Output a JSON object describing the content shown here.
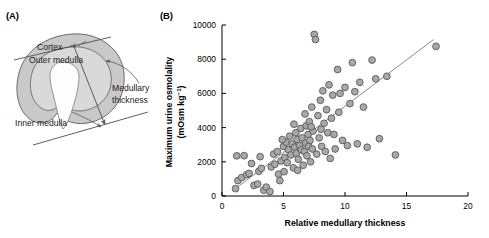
{
  "figure": {
    "panel_a_label": "(A)",
    "panel_b_label": "(B)"
  },
  "diagram": {
    "name": "kidney-medullary-thickness-diagram",
    "labels": {
      "cortex": "Cortex",
      "outer_medulla": "Outer medulla",
      "inner_medulla": "Inner medulla",
      "medullary_thickness_line1": "Medullary",
      "medullary_thickness_line2": "thickness"
    },
    "colors": {
      "cortex_fill": "#c9c9c9",
      "outer_medulla_fill": "#d9d9d9",
      "inner_medulla_fill": "#fdfdfd",
      "outline": "#6b6b6b",
      "arrow": "#5a5a5a"
    }
  },
  "chart_data": {
    "type": "scatter",
    "title": "",
    "xlabel": "Relative medullary thickness",
    "ylabel": "Maximum urine osmolality",
    "ylabel_units": "(mOsm kg",
    "ylabel_exponent": "−1",
    "ylabel_units_close": ")",
    "xlim": [
      0,
      20
    ],
    "ylim": [
      0,
      10000
    ],
    "xticks": [
      0,
      5,
      10,
      15,
      20
    ],
    "xtick_labels": [
      "0",
      "5",
      "10",
      "15",
      "20"
    ],
    "yticks": [
      0,
      2000,
      4000,
      6000,
      8000,
      10000
    ],
    "ytick_labels": [
      "0",
      "2000",
      "4000",
      "6000",
      "8000",
      "10000"
    ],
    "grid": false,
    "legend": false,
    "marker": {
      "shape": "circle",
      "fill": "#a8a8a8",
      "edge": "#4d4d4d",
      "size": 3.4
    },
    "trendline": {
      "visible": true,
      "color": "#8a8a8a",
      "x_start": 1.0,
      "y_start": 380,
      "x_end": 17.2,
      "y_end": 9150
    },
    "points": [
      [
        1.2,
        2350
      ],
      [
        1.8,
        2360
      ],
      [
        1.3,
        900
      ],
      [
        1.6,
        1080
      ],
      [
        2.0,
        1240
      ],
      [
        2.2,
        1320
      ],
      [
        1.1,
        430
      ],
      [
        2.6,
        620
      ],
      [
        2.9,
        700
      ],
      [
        3.0,
        1450
      ],
      [
        3.2,
        1620
      ],
      [
        3.4,
        340
      ],
      [
        3.6,
        520
      ],
      [
        3.9,
        260
      ],
      [
        4.0,
        1700
      ],
      [
        4.2,
        2450
      ],
      [
        4.3,
        1860
      ],
      [
        4.5,
        2600
      ],
      [
        4.6,
        1280
      ],
      [
        4.7,
        900
      ],
      [
        4.8,
        2050
      ],
      [
        5.0,
        2900
      ],
      [
        5.1,
        2250
      ],
      [
        5.2,
        3150
      ],
      [
        5.3,
        1950
      ],
      [
        5.4,
        2700
      ],
      [
        5.5,
        3500
      ],
      [
        5.6,
        2400
      ],
      [
        5.7,
        3050
      ],
      [
        5.8,
        1650
      ],
      [
        5.9,
        2850
      ],
      [
        6.0,
        3700
      ],
      [
        6.05,
        2500
      ],
      [
        6.1,
        3300
      ],
      [
        6.2,
        2150
      ],
      [
        6.3,
        2950
      ],
      [
        6.4,
        3950
      ],
      [
        6.45,
        2700
      ],
      [
        6.5,
        3400
      ],
      [
        6.6,
        1800
      ],
      [
        6.7,
        2600
      ],
      [
        6.8,
        3100
      ],
      [
        6.85,
        4100
      ],
      [
        6.9,
        2350
      ],
      [
        7.0,
        3600
      ],
      [
        7.05,
        2900
      ],
      [
        7.1,
        4350
      ],
      [
        7.15,
        3250
      ],
      [
        7.2,
        2000
      ],
      [
        7.3,
        5200
      ],
      [
        7.35,
        2750
      ],
      [
        7.4,
        3800
      ],
      [
        7.5,
        9450
      ],
      [
        7.6,
        9150
      ],
      [
        7.7,
        2450
      ],
      [
        7.8,
        4700
      ],
      [
        7.9,
        3400
      ],
      [
        8.0,
        5600
      ],
      [
        8.1,
        2900
      ],
      [
        8.2,
        6150
      ],
      [
        8.3,
        4250
      ],
      [
        8.4,
        2600
      ],
      [
        8.5,
        5050
      ],
      [
        8.6,
        3700
      ],
      [
        8.7,
        6500
      ],
      [
        8.8,
        2200
      ],
      [
        8.9,
        4550
      ],
      [
        9.0,
        5900
      ],
      [
        9.2,
        2750
      ],
      [
        9.4,
        7400
      ],
      [
        9.5,
        4900
      ],
      [
        9.6,
        6000
      ],
      [
        9.8,
        3250
      ],
      [
        10.0,
        6350
      ],
      [
        10.2,
        2950
      ],
      [
        10.4,
        5400
      ],
      [
        10.6,
        7800
      ],
      [
        10.8,
        6100
      ],
      [
        11.0,
        3050
      ],
      [
        11.2,
        6650
      ],
      [
        11.5,
        5200
      ],
      [
        11.8,
        2850
      ],
      [
        12.2,
        7950
      ],
      [
        12.5,
        6850
      ],
      [
        12.8,
        3350
      ],
      [
        13.4,
        7000
      ],
      [
        14.1,
        2400
      ],
      [
        17.4,
        8750
      ],
      [
        3.1,
        2300
      ],
      [
        2.4,
        1900
      ],
      [
        5.05,
        1420
      ],
      [
        6.15,
        1500
      ],
      [
        4.9,
        3300
      ],
      [
        7.25,
        4050
      ],
      [
        8.05,
        3900
      ],
      [
        6.75,
        4800
      ],
      [
        5.85,
        4200
      ],
      [
        9.1,
        3600
      ]
    ],
    "n_points": 98
  }
}
